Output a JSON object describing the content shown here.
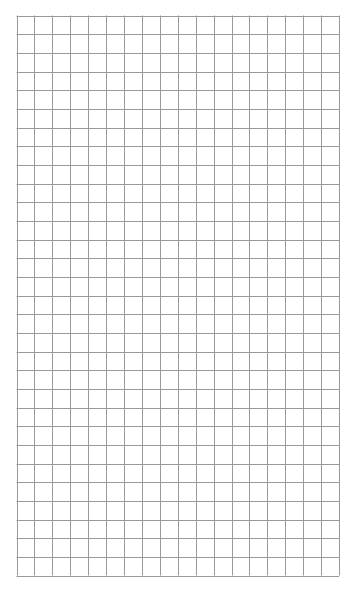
{
  "page": {
    "type": "graph-paper",
    "background_color": "#ffffff"
  },
  "grid": {
    "columns": 18,
    "rows": 30,
    "line_color": "#9a9a9a",
    "line_width": 1,
    "left": 16.5,
    "top": 15.5,
    "width": 322.5,
    "height": 560
  }
}
